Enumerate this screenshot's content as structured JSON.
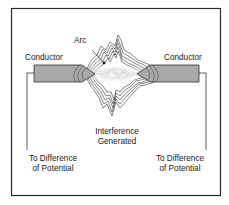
{
  "diagram": {
    "title": "",
    "labels": {
      "arc": "Arc",
      "conductor_left": "Conductor",
      "conductor_right": "Conductor",
      "interference_line1": "Interference",
      "interference_line2": "Generated",
      "left_lead_line1": "To Difference",
      "left_lead_line2": "of Potential",
      "right_lead_line1": "To Difference",
      "right_lead_line2": "of Potential"
    },
    "colors": {
      "frame": "#2a2a2a",
      "conductor_fill": "#a9a9a9",
      "lines": "#333333",
      "glow": "#cfcfcf"
    }
  }
}
